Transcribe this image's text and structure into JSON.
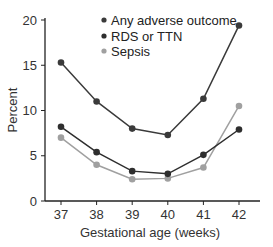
{
  "chart_data": {
    "type": "line",
    "title": "",
    "xlabel": "Gestational age (weeks)",
    "ylabel": "Percent",
    "x": [
      37,
      38,
      39,
      40,
      41,
      42
    ],
    "x_tick_labels": [
      "37",
      "38",
      "39",
      "40",
      "41",
      "42"
    ],
    "y_ticks": [
      0,
      5,
      10,
      15,
      20
    ],
    "y_tick_labels": [
      "0",
      "5",
      "10",
      "15",
      "20"
    ],
    "ylim": [
      0,
      20
    ],
    "grid": false,
    "legend_position": "upper-center",
    "series": [
      {
        "name": "Any adverse outcome",
        "color": "#3a3a3a",
        "values": [
          15.3,
          11.0,
          8.0,
          7.3,
          11.3,
          19.4
        ]
      },
      {
        "name": "RDS or TTN",
        "color": "#2e2e2e",
        "values": [
          8.2,
          5.4,
          3.3,
          3.0,
          5.1,
          7.9
        ]
      },
      {
        "name": "Sepsis",
        "color": "#a0a0a0",
        "values": [
          7.0,
          4.0,
          2.4,
          2.5,
          3.7,
          10.5
        ]
      }
    ]
  }
}
